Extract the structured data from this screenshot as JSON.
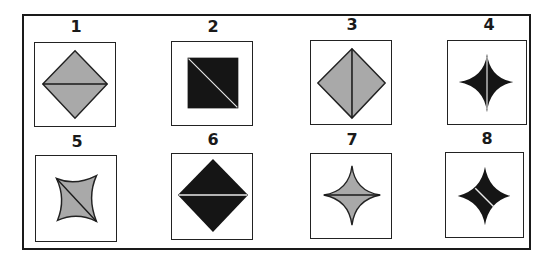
{
  "puzzle": {
    "colors": {
      "gray": "#a9a9a9",
      "black": "#151515",
      "outline": "#222222",
      "line_on_gray": "#1a1a1a",
      "line_on_black": "#e8e8e8"
    },
    "figures": [
      {
        "label": "1",
        "shape": "diamond",
        "fill": "gray",
        "divider": "horizontal"
      },
      {
        "label": "2",
        "shape": "square",
        "fill": "black",
        "divider": "diagonal-tl-br"
      },
      {
        "label": "3",
        "shape": "diamond",
        "fill": "gray",
        "divider": "vertical"
      },
      {
        "label": "4",
        "shape": "concave-star",
        "fill": "black",
        "divider": "vertical"
      },
      {
        "label": "5",
        "shape": "concave-square",
        "fill": "gray",
        "divider": "diagonal-tl-br"
      },
      {
        "label": "6",
        "shape": "diamond",
        "fill": "black",
        "divider": "horizontal"
      },
      {
        "label": "7",
        "shape": "concave-star",
        "fill": "gray",
        "divider": "horizontal"
      },
      {
        "label": "8",
        "shape": "concave-star",
        "fill": "black",
        "divider": "diagonal-tl-br"
      }
    ]
  }
}
